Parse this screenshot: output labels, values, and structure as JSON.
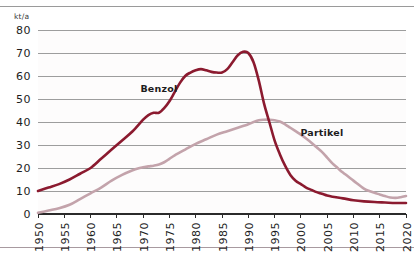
{
  "chart_data": {
    "type": "line",
    "title": "",
    "subtitle": "",
    "xlabel": "",
    "ylabel": "kt/a",
    "unit_label": "kt/a",
    "xlim": [
      1950,
      2020
    ],
    "ylim": [
      0,
      80
    ],
    "grid": "horizontal",
    "legend_position": "inline-annotation",
    "x_tick_labels": [
      "1950",
      "1955",
      "1960",
      "1965",
      "1970",
      "1975",
      "1980",
      "1985",
      "1990",
      "1995",
      "2000",
      "2005",
      "2010",
      "2015",
      "2020"
    ],
    "x_ticks": [
      1950,
      1955,
      1960,
      1965,
      1970,
      1975,
      1980,
      1985,
      1990,
      1995,
      2000,
      2005,
      2010,
      2015,
      2020
    ],
    "y_tick_labels": [
      "0",
      "10",
      "20",
      "30",
      "40",
      "50",
      "60",
      "70",
      "80"
    ],
    "y_ticks": [
      0,
      10,
      20,
      30,
      40,
      50,
      60,
      70,
      80
    ],
    "colors": {
      "benzol": "#8B1A2F",
      "partikel": "#C3A3AB",
      "gridline": "#9d9d9d",
      "axis": "#2a2a2a",
      "text": "#1d1d1d",
      "background": "#ffffff"
    },
    "series": [
      {
        "name": "Benzol",
        "color": "#8B1A2F",
        "label_x": 1973,
        "label_y": 53,
        "x": [
          1950,
          1952,
          1954,
          1956,
          1958,
          1960,
          1962,
          1964,
          1966,
          1968,
          1970,
          1971,
          1972,
          1973,
          1974,
          1975,
          1976,
          1977,
          1978,
          1979,
          1980,
          1981,
          1982,
          1983,
          1984,
          1985,
          1986,
          1987,
          1988,
          1989,
          1990,
          1991,
          1992,
          1993,
          1994,
          1995,
          1996,
          1997,
          1998,
          1999,
          2000,
          2001,
          2002,
          2003,
          2004,
          2005,
          2006,
          2008,
          2010,
          2012,
          2014,
          2016,
          2018,
          2020
        ],
        "values": [
          10,
          11.5,
          13,
          15,
          17.5,
          20,
          24,
          28,
          32,
          36,
          41,
          43,
          44,
          44,
          46,
          49,
          53,
          57,
          60,
          61.5,
          62.5,
          63,
          62.5,
          61.8,
          61.5,
          61.5,
          63,
          66,
          69,
          70.5,
          70,
          66,
          58,
          48,
          40,
          32,
          26,
          21,
          17,
          14.5,
          13,
          11.5,
          10.5,
          9.5,
          8.8,
          8,
          7.5,
          6.8,
          6,
          5.5,
          5.2,
          5,
          4.8,
          4.8
        ]
      },
      {
        "name": "Partikel",
        "color": "#C3A3AB",
        "label_x": 2004,
        "label_y": 34,
        "x": [
          1950,
          1952,
          1954,
          1956,
          1958,
          1960,
          1962,
          1964,
          1966,
          1968,
          1969,
          1970,
          1971,
          1972,
          1973,
          1974,
          1975,
          1976,
          1978,
          1980,
          1982,
          1984,
          1986,
          1988,
          1990,
          1991,
          1992,
          1993,
          1994,
          1995,
          1996,
          1997,
          1998,
          1999,
          2000,
          2001,
          2002,
          2003,
          2004,
          2005,
          2006,
          2007,
          2008,
          2010,
          2012,
          2013,
          2014,
          2015,
          2016,
          2017,
          2018,
          2019,
          2020
        ],
        "values": [
          0.5,
          1.5,
          2.5,
          4,
          6.5,
          9,
          11.5,
          14.5,
          17,
          19,
          19.8,
          20.3,
          20.7,
          21,
          21.5,
          22.5,
          24,
          25.5,
          28,
          30.5,
          32.5,
          34.5,
          36,
          37.5,
          39,
          40,
          40.8,
          41,
          41,
          40.8,
          40.2,
          39,
          37.5,
          36,
          34.5,
          32.8,
          31,
          29,
          27,
          24.5,
          22,
          20,
          18,
          14.5,
          11,
          10,
          9.2,
          8.5,
          7.8,
          7.2,
          7,
          7.3,
          7.8
        ]
      }
    ],
    "annotations": [
      {
        "text": "Benzol",
        "x": 1973,
        "y": 53
      },
      {
        "text": "Partikel",
        "x": 2004,
        "y": 34
      }
    ]
  }
}
